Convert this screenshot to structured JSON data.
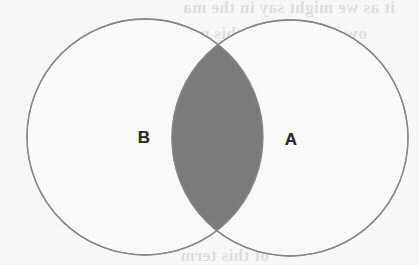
{
  "figure": {
    "type": "venn-diagram",
    "background_color": "#fdfdfd",
    "outline_color": "#8a8a8a",
    "circle_fill_color": "#ffffff",
    "intersection_fill_color": "#7e7e7e",
    "label_color": "#2b2b2b",
    "sets": [
      {
        "name": "set-b",
        "label": "B",
        "position": "left",
        "center_x": 145,
        "center_y": 137,
        "radius": 118,
        "label_x": 144,
        "label_y": 137,
        "shaded": false
      },
      {
        "name": "set-a",
        "label": "A",
        "position": "right",
        "center_x": 290,
        "center_y": 138,
        "radius": 118,
        "label_x": 291,
        "label_y": 139,
        "shaded": false
      }
    ],
    "intersection": {
      "name": "a-intersect-b",
      "shaded": true,
      "fill_color": "#7e7e7e",
      "left_x": 172,
      "right_x": 263,
      "top_y": 46,
      "bottom_y": 228
    }
  },
  "bleed_through_text": {
    "description": "faint mirrored show-through text from the reverse side of the scanned page",
    "lines": [
      "it as we might say in the ma",
      "ow. implies that this prob",
      "neous member to Region 10",
      "from MAPPE to th",
      "denominator shall  us",
      "in this, formu",
      "MAPDE = This Shepill(½AA-",
      "of this term"
    ]
  }
}
